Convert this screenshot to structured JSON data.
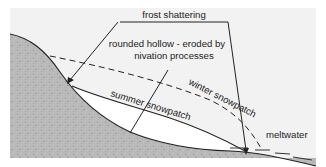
{
  "diagram": {
    "labels": {
      "frost_shattering": "frost shattering",
      "rounded_hollow_line1": "rounded hollow - eroded by",
      "rounded_hollow_line2": "nivation processes",
      "winter_snowpatch": "winter snowpatch",
      "summer_snowpatch": "summer snowpatch",
      "meltwater": "meltwater"
    },
    "colors": {
      "background_panel": "#f2f2f2",
      "ground_fill": "#b8b8b8",
      "snow_fill": "#ffffff",
      "line": "#222222"
    }
  }
}
